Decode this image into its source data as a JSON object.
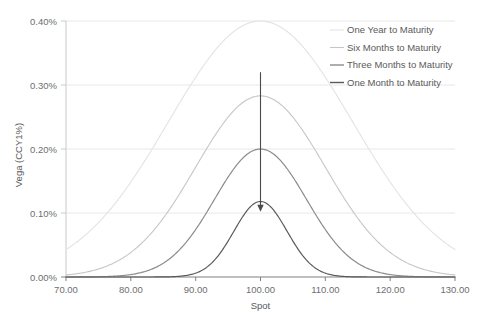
{
  "chart_data": {
    "type": "line",
    "title": "",
    "xlabel": "Spot",
    "ylabel": "Vega (CCY1%)",
    "xlim": [
      70,
      130
    ],
    "ylim": [
      0,
      0.004
    ],
    "grid": "horizontal",
    "legend_position": "top-right",
    "x_ticks": [
      "70.00",
      "80.00",
      "90.00",
      "100.00",
      "110.00",
      "120.00",
      "130.00"
    ],
    "x_tick_values": [
      70,
      80,
      90,
      100,
      110,
      120,
      130
    ],
    "y_ticks": [
      "0.00%",
      "0.10%",
      "0.20%",
      "0.30%",
      "0.40%"
    ],
    "y_tick_values": [
      0,
      0.001,
      0.002,
      0.003,
      0.004
    ],
    "series": [
      {
        "name": "One Year to Maturity",
        "color": "#e3e3e3",
        "width": 1.1,
        "peak_x": 100,
        "peak_y": 0.004,
        "sigma": 14.2
      },
      {
        "name": "Six Months to Maturity",
        "color": "#c6c6c6",
        "width": 1.1,
        "peak_x": 100,
        "peak_y": 0.00283,
        "sigma": 10.0
      },
      {
        "name": "Three Months to Maturity",
        "color": "#8c8c8c",
        "width": 1.2,
        "peak_x": 100,
        "peak_y": 0.002,
        "sigma": 7.1
      },
      {
        "name": "One Month to Maturity",
        "color": "#5a5a5a",
        "width": 1.2,
        "peak_x": 100,
        "peak_y": 0.00118,
        "sigma": 4.1
      }
    ],
    "annotations": [
      {
        "kind": "arrow",
        "label": "downward-arrow-at-atm",
        "x": 100,
        "y_start": 0.0032,
        "y_end": 0.00105,
        "color": "#4a4a4a"
      }
    ]
  },
  "legend": {
    "items": [
      {
        "label": "One Year to Maturity",
        "color": "#e3e3e3"
      },
      {
        "label": "Six Months to Maturity",
        "color": "#c6c6c6"
      },
      {
        "label": "Three Months to Maturity",
        "color": "#8c8c8c"
      },
      {
        "label": "One Month to Maturity",
        "color": "#5a5a5a"
      }
    ]
  },
  "axes": {
    "x_title": "Spot",
    "y_title": "Vega (CCY1%)"
  },
  "colors": {
    "gridline": "#e8e8e8",
    "axis": "#868686",
    "text": "#595959"
  }
}
